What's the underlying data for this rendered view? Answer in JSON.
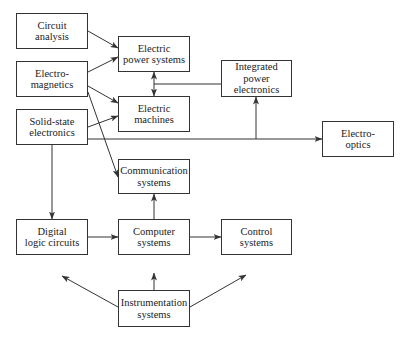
{
  "diagram": {
    "nodes": [
      {
        "id": "circuit",
        "label": "Circuit\nanalysis",
        "x": 16,
        "y": 13,
        "w": 72,
        "h": 36
      },
      {
        "id": "electromag",
        "label": "Electro-\nmagnetics",
        "x": 16,
        "y": 61,
        "w": 72,
        "h": 36
      },
      {
        "id": "solidstate",
        "label": "Solid-state\nelectronics",
        "x": 16,
        "y": 109,
        "w": 72,
        "h": 36
      },
      {
        "id": "power",
        "label": "Electric\npower systems",
        "x": 118,
        "y": 36,
        "w": 72,
        "h": 36
      },
      {
        "id": "machines",
        "label": "Electric\nmachines",
        "x": 118,
        "y": 96,
        "w": 72,
        "h": 36
      },
      {
        "id": "ipe",
        "label": "Integrated\npower\nelectronics",
        "x": 221,
        "y": 60,
        "w": 71,
        "h": 37
      },
      {
        "id": "optics",
        "label": "Electro-\noptics",
        "x": 322,
        "y": 121,
        "w": 72,
        "h": 36
      },
      {
        "id": "comm",
        "label": "Communication\nsystems",
        "x": 118,
        "y": 159,
        "w": 72,
        "h": 35
      },
      {
        "id": "digital",
        "label": "Digital\nlogic circuits",
        "x": 16,
        "y": 219,
        "w": 72,
        "h": 36
      },
      {
        "id": "computer",
        "label": "Computer\nsystems",
        "x": 118,
        "y": 219,
        "w": 72,
        "h": 36
      },
      {
        "id": "control",
        "label": "Control\nsystems",
        "x": 221,
        "y": 219,
        "w": 71,
        "h": 36
      },
      {
        "id": "instr",
        "label": "Instrumentation\nsystems",
        "x": 118,
        "y": 290,
        "w": 72,
        "h": 37
      }
    ],
    "edges": [
      {
        "from": "circuit",
        "to": "power",
        "points": [
          [
            88,
            31
          ],
          [
            118,
            48
          ]
        ],
        "arrow": "end"
      },
      {
        "from": "electromag",
        "to": "power",
        "points": [
          [
            88,
            72
          ],
          [
            118,
            57
          ]
        ],
        "arrow": "end"
      },
      {
        "from": "electromag",
        "to": "machines",
        "points": [
          [
            88,
            86
          ],
          [
            118,
            103
          ]
        ],
        "arrow": "end"
      },
      {
        "from": "electromag",
        "to": "comm",
        "points": [
          [
            88,
            92
          ],
          [
            118,
            177
          ]
        ],
        "arrow": "end"
      },
      {
        "from": "solidstate",
        "to": "machines",
        "points": [
          [
            88,
            127
          ],
          [
            118,
            116
          ]
        ],
        "arrow": "end"
      },
      {
        "from": "power",
        "to": "machines",
        "points": [
          [
            154,
            72
          ],
          [
            154,
            96
          ]
        ],
        "arrow": "both"
      },
      {
        "from": "ipe",
        "to": "power-machines",
        "points": [
          [
            221,
            84
          ],
          [
            154,
            84
          ]
        ],
        "arrow": "none"
      },
      {
        "from": "solidstate",
        "to": "optics",
        "points": [
          [
            88,
            139
          ],
          [
            322,
            139
          ]
        ],
        "arrow": "end"
      },
      {
        "from": "trunk",
        "to": "ipe",
        "points": [
          [
            256,
            139
          ],
          [
            256,
            97
          ]
        ],
        "arrow": "end"
      },
      {
        "from": "solidstate",
        "to": "digital",
        "points": [
          [
            52,
            145
          ],
          [
            52,
            219
          ]
        ],
        "arrow": "end"
      },
      {
        "from": "digital",
        "to": "computer",
        "points": [
          [
            88,
            237
          ],
          [
            118,
            237
          ]
        ],
        "arrow": "end"
      },
      {
        "from": "computer",
        "to": "comm",
        "points": [
          [
            154,
            219
          ],
          [
            154,
            194
          ]
        ],
        "arrow": "end"
      },
      {
        "from": "computer",
        "to": "control",
        "points": [
          [
            190,
            237
          ],
          [
            221,
            237
          ]
        ],
        "arrow": "end"
      },
      {
        "from": "instr",
        "to": "computer",
        "points": [
          [
            154,
            290
          ],
          [
            154,
            273
          ]
        ],
        "arrow": "end"
      },
      {
        "from": "instr",
        "to": "digital",
        "points": [
          [
            118,
            307
          ],
          [
            62,
            276
          ]
        ],
        "arrow": "end"
      },
      {
        "from": "instr",
        "to": "control",
        "points": [
          [
            190,
            307
          ],
          [
            246,
            275
          ]
        ],
        "arrow": "end"
      }
    ],
    "colors": {
      "stroke": "#333333",
      "text": "#222222",
      "background": "#ffffff"
    }
  }
}
